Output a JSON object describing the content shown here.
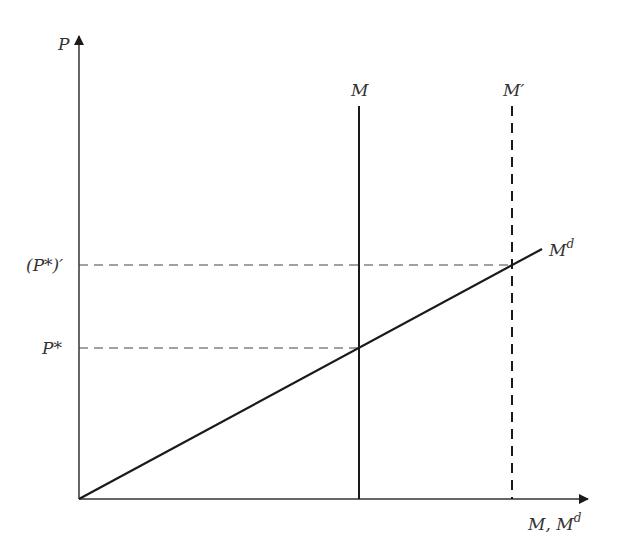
{
  "diagram": {
    "title": "",
    "axes": {
      "y_label": "P",
      "x_label_main": "M, M",
      "x_label_sup": "d"
    },
    "curves": {
      "money_supply": {
        "label": "M",
        "style": "solid"
      },
      "money_supply_new": {
        "label": "M′",
        "style": "dashed"
      },
      "money_demand": {
        "label_main": "M",
        "label_sup": "d",
        "style": "solid"
      }
    },
    "levels": {
      "p_star": {
        "label": "P*",
        "style": "dashed"
      },
      "p_star_prime": {
        "label": "(P*)′",
        "style": "dashed"
      }
    },
    "colors": {
      "line": "#1a1a1a",
      "axis": "#333333",
      "text": "#333333",
      "background": "#ffffff"
    }
  }
}
